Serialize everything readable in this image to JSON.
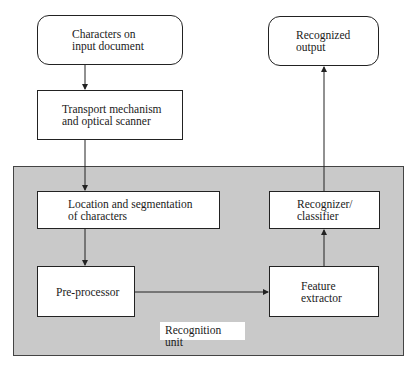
{
  "diagram": {
    "nodes": {
      "input": {
        "line1": "Characters on",
        "line2": "input document"
      },
      "transport": {
        "line1": "Transport mechanism",
        "line2": "and optical scanner"
      },
      "output": {
        "line1": "Recognized",
        "line2": "output"
      },
      "location": {
        "line1": "Location and segmentation",
        "line2": "of characters"
      },
      "recognizer": {
        "line1": "Recognizer/",
        "line2": "classifier"
      },
      "preprocessor": {
        "line1": "Pre-processor"
      },
      "feature": {
        "line1": "Feature",
        "line2": "extractor"
      }
    },
    "region_label": "Recognition unit",
    "edges": [
      {
        "from": "input",
        "to": "transport"
      },
      {
        "from": "transport",
        "to": "location"
      },
      {
        "from": "location",
        "to": "preprocessor"
      },
      {
        "from": "preprocessor",
        "to": "feature"
      },
      {
        "from": "feature",
        "to": "recognizer"
      },
      {
        "from": "recognizer",
        "to": "output"
      }
    ],
    "colors": {
      "region_fill": "#c9c9c9",
      "box_fill": "#ffffff",
      "line": "#222222"
    }
  }
}
